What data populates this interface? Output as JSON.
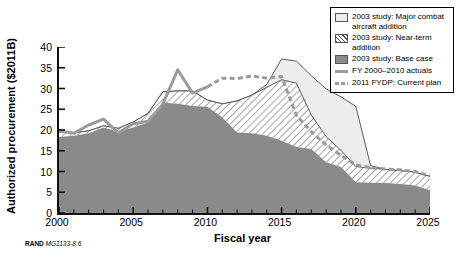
{
  "source_note": {
    "org": "RAND",
    "figure_id": "MG1133-8.6"
  },
  "legend": {
    "items": [
      {
        "label": "2003 study: Major combat aircraft addition",
        "swatch": "light-fill-swatch"
      },
      {
        "label": "2003 study: Near-term addition",
        "swatch": "hatched-fill-swatch"
      },
      {
        "label": "2003 study: Base case",
        "swatch": "dark-fill-swatch"
      },
      {
        "label": "FY 2000–2010 actuals",
        "swatch": "solid-line-swatch"
      },
      {
        "label": "2011 FYDP: Current plan",
        "swatch": "dashed-line-swatch"
      }
    ]
  },
  "colors": {
    "base_case_fill": "#8a8a8a",
    "near_term_fill": "#ffffff",
    "near_term_hatch": "#555555",
    "major_combat_fill": "#ededed",
    "actuals_line": "#9b9b9b",
    "fydp_line": "#9b9b9b",
    "axis": "#111111",
    "background": "#ffffff"
  },
  "chart_data": {
    "type": "area",
    "title": "",
    "xlabel": "Fiscal year",
    "ylabel": "Authorized procurement ($2011B)",
    "xlim": [
      2000,
      2025
    ],
    "ylim": [
      0,
      40
    ],
    "ytick_values": [
      0,
      5,
      10,
      15,
      20,
      25,
      30,
      35,
      40
    ],
    "xtick_values": [
      2000,
      2005,
      2010,
      2015,
      2020,
      2025
    ],
    "xtick_labels": [
      "2000",
      "2005",
      "2010",
      "2015",
      "2020",
      "2025"
    ],
    "minor_xticks_interval": 1,
    "grid": false,
    "legend_position": "top-right",
    "x": [
      2000,
      2001,
      2002,
      2003,
      2004,
      2005,
      2006,
      2007,
      2008,
      2009,
      2010,
      2011,
      2012,
      2013,
      2014,
      2015,
      2016,
      2017,
      2018,
      2019,
      2020,
      2021,
      2022,
      2023,
      2024,
      2025
    ],
    "series": [
      {
        "name": "2003 study: Base case",
        "style": "stacked-area-dark",
        "values": [
          18.3,
          18.6,
          19.2,
          20.6,
          19.6,
          20.6,
          21.8,
          26.6,
          26.3,
          25.8,
          25.6,
          23.0,
          19.4,
          19.2,
          18.6,
          17.4,
          15.9,
          15.4,
          12.2,
          11.1,
          7.4,
          7.3,
          7.2,
          7.0,
          6.6,
          5.5
        ]
      },
      {
        "name": "2003 study: Near-term addition (cumulative top)",
        "style": "stacked-area-hatched",
        "values": [
          19.5,
          19.3,
          19.8,
          21.0,
          20.4,
          21.9,
          24.0,
          29.2,
          29.4,
          29.4,
          27.2,
          26.3,
          27.0,
          28.4,
          30.3,
          32.1,
          31.3,
          23.6,
          18.4,
          15.1,
          11.2,
          10.8,
          10.5,
          10.2,
          9.8,
          8.8
        ]
      },
      {
        "name": "2003 study: Major combat aircraft addition (cumulative top)",
        "style": "stacked-area-light",
        "values": [
          19.5,
          19.3,
          19.8,
          21.0,
          20.4,
          21.9,
          24.0,
          29.2,
          29.4,
          29.4,
          27.2,
          26.3,
          27.0,
          28.4,
          31.0,
          37.1,
          36.6,
          33.1,
          29.9,
          28.0,
          25.7,
          11.4,
          10.5,
          10.2,
          9.8,
          8.8
        ]
      },
      {
        "name": "FY 2000–2010 actuals",
        "style": "solid-line",
        "x": [
          2000,
          2001,
          2002,
          2003,
          2004,
          2005,
          2006,
          2007,
          2008,
          2009,
          2010,
          2011,
          2012,
          2013,
          2014,
          2015,
          2016,
          2017,
          2018,
          2019,
          2020,
          2021,
          2022,
          2023,
          2024,
          2025
        ],
        "values": [
          19.8,
          19.2,
          21.2,
          22.6,
          19.3,
          21.5,
          22.1,
          26.3,
          34.5,
          28.9,
          30.4,
          null,
          null,
          null,
          null,
          null,
          null,
          null,
          null,
          null,
          null,
          null,
          null,
          null,
          null,
          null
        ]
      },
      {
        "name": "2011 FYDP: Current plan",
        "style": "dashed-line",
        "x": [
          2010,
          2011,
          2012,
          2013,
          2014,
          2015,
          2016,
          2017,
          2018,
          2019,
          2020,
          2021,
          2022,
          2023,
          2024,
          2025
        ],
        "values": [
          30.4,
          32.5,
          32.4,
          33.0,
          32.5,
          32.9,
          23.5,
          19.6,
          16.4,
          13.9,
          11.6,
          10.9,
          10.6,
          10.4,
          10.0,
          8.9
        ]
      }
    ],
    "notes": [
      "Actuals line peaks at 34.5 in 2008.",
      "Major combat aircraft addition peaks at 37.1 in 2015 and falls to about 11.4 by 2021.",
      "Base case declines to about 5.5 by 2025."
    ]
  }
}
